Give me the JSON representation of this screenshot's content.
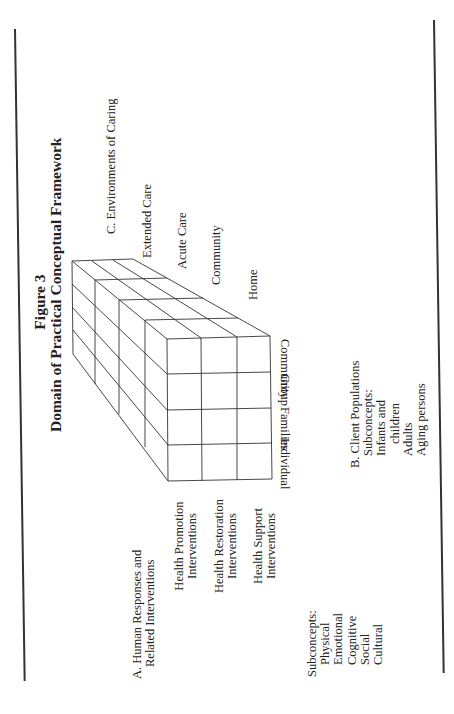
{
  "figure": {
    "number": "Figure 3",
    "title": "Domain of Practical Conceptual Framework"
  },
  "environments": {
    "heading": "C.  Environments of Caring",
    "items": [
      "Extended Care",
      "Acute Care",
      "Community",
      "Home"
    ]
  },
  "client_populations": {
    "heading": "B.  Client Populations",
    "subconcepts_label": "Subconcepts:",
    "subconcepts": [
      "Infants and",
      "children",
      "Adults",
      "Aging persons"
    ],
    "columns": [
      "Individual",
      "Families",
      "Group",
      "Community"
    ]
  },
  "human_responses": {
    "heading_line1": "A.  Human Responses and",
    "heading_line2": "Related Interventions",
    "interventions": [
      {
        "line1": "Health Promotion",
        "line2": "Interventions"
      },
      {
        "line1": "Health Restoration",
        "line2": "Interventions"
      },
      {
        "line1": "Health Support",
        "line2": "Interventions"
      }
    ],
    "subconcepts_label": "Subconcepts:",
    "subconcepts": [
      "Physical",
      "Emotional",
      "Cognitive",
      "Social",
      "Cultural"
    ]
  },
  "colors": {
    "ink": "#222222",
    "rule": "#333333",
    "background": "#ffffff"
  }
}
